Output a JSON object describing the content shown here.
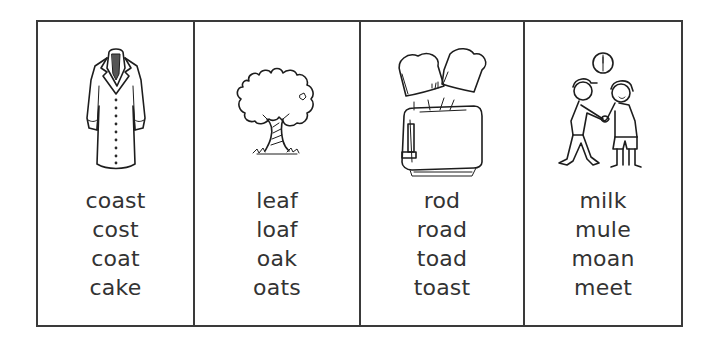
{
  "worksheet": {
    "cards": [
      {
        "picture": "coat-icon",
        "words": [
          "coast",
          "cost",
          "coat",
          "cake"
        ]
      },
      {
        "picture": "oak-tree-icon",
        "words": [
          "leaf",
          "loaf",
          "oak",
          "oats"
        ]
      },
      {
        "picture": "toaster-toast-icon",
        "words": [
          "rod",
          "road",
          "toad",
          "toast"
        ]
      },
      {
        "picture": "boys-meeting-icon",
        "words": [
          "milk",
          "mule",
          "moan",
          "meet"
        ]
      }
    ]
  },
  "colors": {
    "border": "#3a3a3a",
    "text": "#333333",
    "background": "#ffffff"
  }
}
